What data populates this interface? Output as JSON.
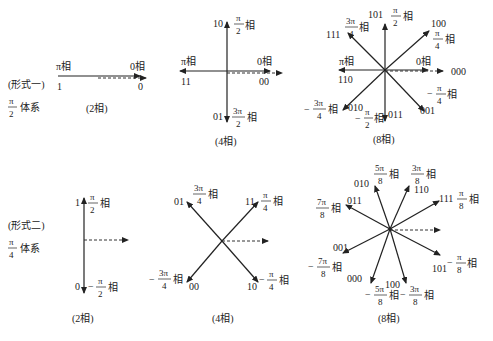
{
  "row1": {
    "form_label": "(形式一)",
    "system": {
      "num": "π",
      "den": "2",
      "suffix": "体系"
    },
    "two_phase": {
      "caption": "(2相)",
      "vectors": [
        {
          "code": "1",
          "phase": "π相"
        },
        {
          "code": "0",
          "phase": "0相"
        }
      ]
    },
    "four_phase": {
      "caption": "(4相)",
      "vectors": [
        {
          "code": "10",
          "phase_num": "π",
          "phase_den": "2",
          "suffix": "相"
        },
        {
          "code": "11",
          "phase": "π相"
        },
        {
          "code": "00",
          "phase": "0相"
        },
        {
          "code": "01",
          "phase_num": "3π",
          "phase_den": "2",
          "suffix": "相"
        }
      ]
    },
    "eight_phase": {
      "caption": "(8相)",
      "vectors": [
        {
          "code": "101",
          "phase_num": "π",
          "phase_den": "2",
          "suffix": "相"
        },
        {
          "code": "111",
          "phase_num": "3π",
          "phase_den": "4",
          "suffix": "相"
        },
        {
          "code": "100",
          "phase_num": "π",
          "phase_den": "4",
          "suffix": "相"
        },
        {
          "code": "110",
          "phase": "π相"
        },
        {
          "code": "000",
          "phase": "0相"
        },
        {
          "code": "010",
          "sign": "−",
          "phase_num": "3π",
          "phase_den": "4",
          "suffix": "相"
        },
        {
          "code": "011",
          "sign": "−",
          "phase_num": "π",
          "phase_den": "2",
          "suffix": "相"
        },
        {
          "code": "001",
          "sign": "−",
          "phase_num": "π",
          "phase_den": "4",
          "suffix": "相"
        }
      ]
    }
  },
  "row2": {
    "form_label": "(形式二)",
    "system": {
      "num": "π",
      "den": "4",
      "suffix": "体系"
    },
    "two_phase": {
      "caption": "(2相)",
      "vectors": [
        {
          "code": "1",
          "phase_num": "π",
          "phase_den": "2",
          "suffix": "相"
        },
        {
          "code": "0",
          "sign": "−",
          "phase_num": "π",
          "phase_den": "2",
          "suffix": "相"
        }
      ]
    },
    "four_phase": {
      "caption": "(4相)",
      "vectors": [
        {
          "code": "01",
          "phase_num": "3π",
          "phase_den": "4",
          "suffix": "相"
        },
        {
          "code": "11",
          "phase_num": "π",
          "phase_den": "4",
          "suffix": "相"
        },
        {
          "code": "00",
          "sign": "−",
          "phase_num": "3π",
          "phase_den": "4",
          "suffix": "相"
        },
        {
          "code": "10",
          "sign": "−",
          "phase_num": "π",
          "phase_den": "4",
          "suffix": "相"
        }
      ]
    },
    "eight_phase": {
      "caption": "(8相)",
      "vectors": [
        {
          "code": "010",
          "phase_num": "5π",
          "phase_den": "8",
          "suffix": "相"
        },
        {
          "code": "110",
          "phase_num": "3π",
          "phase_den": "8",
          "suffix": "相"
        },
        {
          "code": "011",
          "phase_num": "7π",
          "phase_den": "8",
          "suffix": "相"
        },
        {
          "code": "111",
          "phase_num": "π",
          "phase_den": "8",
          "suffix": "相"
        },
        {
          "code": "001",
          "sign": "−",
          "phase_num": "7π",
          "phase_den": "8",
          "suffix": "相"
        },
        {
          "code": "101",
          "sign": "−",
          "phase_num": "π",
          "phase_den": "8",
          "suffix": "相"
        },
        {
          "code": "000",
          "sign": "−",
          "phase_num": "5π",
          "phase_den": "8",
          "suffix": "相"
        },
        {
          "code": "100",
          "sign": "−",
          "phase_num": "3π",
          "phase_den": "8",
          "suffix": "相"
        }
      ]
    }
  }
}
